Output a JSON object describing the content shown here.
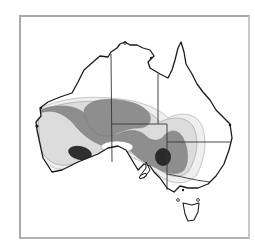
{
  "map": {
    "subject": "Australia",
    "type": "contour-zone map",
    "legend": [],
    "colors": {
      "background": "#ffffff",
      "frame": "#a8a8a8",
      "coastline": "#1a1a1a",
      "state_borders": "#3a3a3a",
      "zone_outer": "#ececec",
      "zone_light": "#d6d6d6",
      "zone_mid": "#8c8c8c",
      "zone_dark": "#2e2e2e",
      "contour_line": "#9a9a9a"
    },
    "zones": [
      {
        "name": "outer",
        "level": 1
      },
      {
        "name": "light",
        "level": 2
      },
      {
        "name": "mid",
        "level": 3
      },
      {
        "name": "core-west",
        "level": 4
      },
      {
        "name": "core-east",
        "level": 4
      }
    ]
  }
}
